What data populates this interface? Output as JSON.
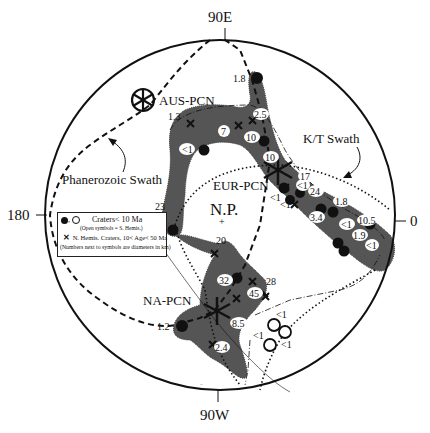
{
  "axes": {
    "top": "90E",
    "bottom": "90W",
    "left": "180",
    "right": "0"
  },
  "center_label": "N.P.",
  "regions": [
    {
      "name": "AUS-PCN",
      "label": "AUS-PCN"
    },
    {
      "name": "EUR-PCN",
      "label": "EUR-PCN"
    },
    {
      "name": "NA-PCN",
      "label": "NA-PCN"
    }
  ],
  "swaths": {
    "phanerozoic": "Phanerozoic Swath",
    "kt": "K/T Swath"
  },
  "legend": {
    "row1_text": "Craters< 10 Ma",
    "row2_text": "(Open symbols = S. Hemis.)",
    "row3_text": "N. Hemis. Craters, 10< Age< 50 Ma",
    "row4_text": "(Numbers next to symbols are diameters in km)"
  },
  "crater_labels": {
    "c_1_8_top": "1.8",
    "c_1_3": "1.3",
    "c_2_5": "2.5",
    "c_7": "7",
    "c_10_a": "10",
    "c_lt1_a": "<1",
    "c_10_b": "10",
    "c_23": "23",
    "c_17": "17",
    "c_lt1_b": "<1",
    "c_24": "24",
    "c_lt1_c": "<1",
    "c_lt1_d": "<1",
    "c_1_8_b": "1.8",
    "c_3_4": "3.4",
    "c_lt1_e": "<1",
    "c_10_5": "10.5",
    "c_1_9": "1.9",
    "c_lt1_f": "<1",
    "c_20": "20",
    "c_32": "32",
    "c_28": "28",
    "c_45": "45",
    "c_8_5": "8.5",
    "c_1_2": "1.2",
    "c_2_4": "2.4",
    "s_lt1_a": "<1",
    "s_lt1_b": "<1",
    "s_lt1_c": "<1"
  },
  "colors": {
    "shaded_region": "#555555",
    "line": "#111111",
    "background": "#ffffff"
  }
}
